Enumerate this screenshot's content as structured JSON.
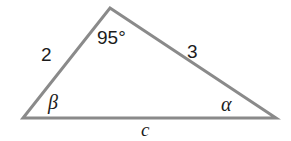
{
  "figure": {
    "type": "geometry-diagram",
    "shape": "triangle",
    "background_color": "#ffffff",
    "stroke_color": "#8a8a8a",
    "text_color": "#1c1c1c",
    "stroke_width": 3,
    "width": 291,
    "height": 141,
    "vertices": {
      "apex": {
        "x": 110,
        "y": 8
      },
      "bottom_left": {
        "x": 23,
        "y": 118
      },
      "bottom_right": {
        "x": 276,
        "y": 118
      }
    },
    "labels": {
      "apex_angle": "95°",
      "left_side": "2",
      "right_side": "3",
      "bottom_left_angle": "β",
      "bottom_right_angle": "α",
      "bottom_side": "c"
    }
  }
}
